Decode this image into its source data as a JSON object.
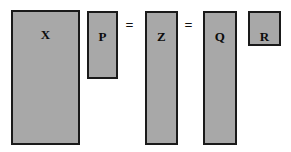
{
  "diagram": {
    "type": "matrix-factorization-equation",
    "canvas": {
      "width": 291,
      "height": 152,
      "background": "#ffffff"
    },
    "style": {
      "fill_color": "#a8a8a8",
      "border_color": "#1a1a1a",
      "border_width_px": 2,
      "label_color": "#0d0d0d"
    },
    "blocks": [
      {
        "id": "x",
        "label": "X",
        "x": 11,
        "y": 10,
        "width": 69,
        "height": 135,
        "label_top": 16
      },
      {
        "id": "p",
        "label": "P",
        "x": 87,
        "y": 11,
        "width": 31,
        "height": 68,
        "label_top": 17
      },
      {
        "id": "z",
        "label": "Z",
        "x": 145,
        "y": 11,
        "width": 33,
        "height": 134,
        "label_top": 17
      },
      {
        "id": "q",
        "label": "Q",
        "x": 203,
        "y": 11,
        "width": 34,
        "height": 134,
        "label_top": 17
      },
      {
        "id": "r",
        "label": "R",
        "x": 248,
        "y": 11,
        "width": 33,
        "height": 35,
        "label_top": 17
      }
    ],
    "operators": [
      {
        "id": "equals-1",
        "symbol": "=",
        "x": 123,
        "y": 19,
        "width": 13
      },
      {
        "id": "equals-2",
        "symbol": "=",
        "x": 182,
        "y": 19,
        "width": 13
      }
    ]
  }
}
